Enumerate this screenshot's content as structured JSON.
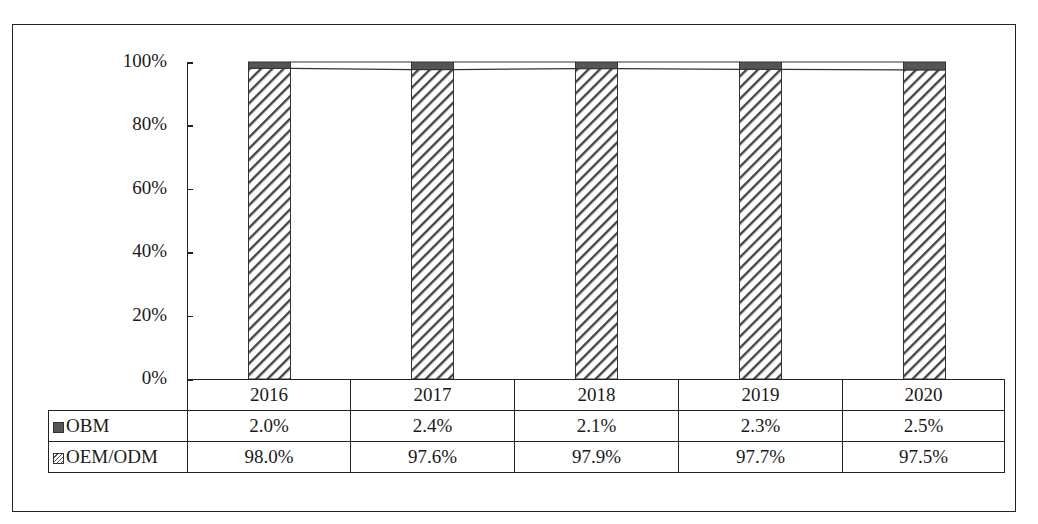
{
  "chart_data": {
    "type": "bar",
    "stacked": true,
    "percent_stacked": true,
    "title": "",
    "xlabel": "",
    "ylabel": "",
    "ylim": [
      0,
      100
    ],
    "y_ticks": [
      "0%",
      "20%",
      "40%",
      "60%",
      "80%",
      "100%"
    ],
    "categories": [
      "2016",
      "2017",
      "2018",
      "2019",
      "2020"
    ],
    "series": [
      {
        "name": "OEM/ODM",
        "values": [
          98.0,
          97.6,
          97.9,
          97.7,
          97.5
        ],
        "labels": [
          "98.0%",
          "97.6%",
          "97.9%",
          "97.7%",
          "97.5%"
        ],
        "pattern": "diagonal-hatch",
        "color": "#555555"
      },
      {
        "name": "OBM",
        "values": [
          2.0,
          2.4,
          2.1,
          2.3,
          2.5
        ],
        "labels": [
          "2.0%",
          "2.4%",
          "2.1%",
          "2.3%",
          "2.5%"
        ],
        "pattern": "solid",
        "color": "#555555"
      }
    ],
    "series_lines": true,
    "data_table": true,
    "grid": false,
    "legend_position": "data-table"
  },
  "table": {
    "rows": [
      {
        "key": "OBM",
        "label": "OBM",
        "cells": [
          "2.0%",
          "2.4%",
          "2.1%",
          "2.3%",
          "2.5%"
        ]
      },
      {
        "key": "OEM",
        "label": "OEM/ODM",
        "cells": [
          "98.0%",
          "97.6%",
          "97.9%",
          "97.7%",
          "97.5%"
        ]
      }
    ]
  }
}
